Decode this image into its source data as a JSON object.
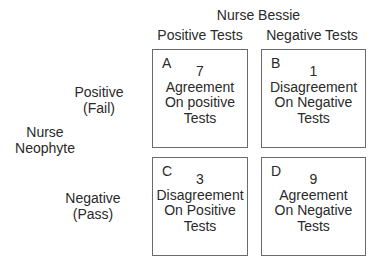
{
  "header": {
    "title": "Nurse Bessie",
    "columns": [
      {
        "label": "Positive Tests"
      },
      {
        "label": "Negative Tests"
      }
    ]
  },
  "row_group": {
    "label_line1": "Nurse",
    "label_line2": "Neophyte"
  },
  "rows": [
    {
      "label_line1": "Positive",
      "label_line2": "(Fail)"
    },
    {
      "label_line1": "Negative",
      "label_line2": "(Pass)"
    }
  ],
  "cells": [
    {
      "letter": "A",
      "count": "7",
      "line1": "Agreement",
      "line2": "On positive",
      "line3": "Tests"
    },
    {
      "letter": "B",
      "count": "1",
      "line1": "Disagreement",
      "line2": "On Negative",
      "line3": "Tests"
    },
    {
      "letter": "C",
      "count": "3",
      "line1": "Disagreement",
      "line2": "On Positive",
      "line3": "Tests"
    },
    {
      "letter": "D",
      "count": "9",
      "line1": "Agreement",
      "line2": "On Negative",
      "line3": "Tests"
    }
  ],
  "colors": {
    "border": "#6a6a6a",
    "text": "#2a2a2a",
    "background": "#ffffff"
  }
}
